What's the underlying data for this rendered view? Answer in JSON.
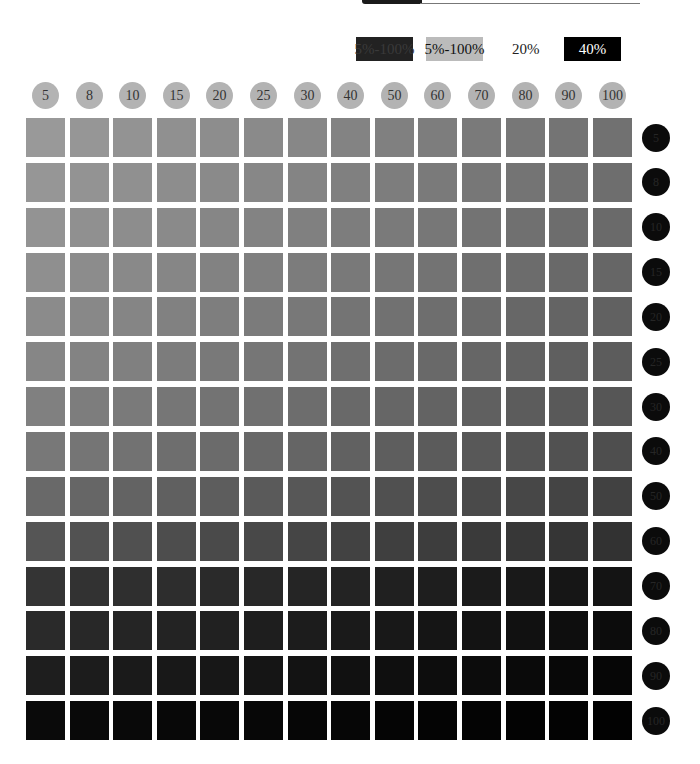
{
  "legend": [
    {
      "label": "5%-100%",
      "bg": "#222222",
      "fg": "#3a3a3a",
      "x": 356
    },
    {
      "label": "5%-100%",
      "bg": "#bbbbbb",
      "fg": "#111111",
      "x": 426
    },
    {
      "label": "20%",
      "bg": "transparent",
      "fg": "#222222",
      "x": 512,
      "plain": true
    },
    {
      "label": "40%",
      "bg": "#000000",
      "fg": "#ffffff",
      "x": 564
    }
  ],
  "chart_data": {
    "type": "heatmap",
    "title": "",
    "xlabel": "",
    "ylabel": "",
    "columns": [
      "5",
      "8",
      "10",
      "15",
      "20",
      "25",
      "30",
      "40",
      "50",
      "60",
      "70",
      "80",
      "90",
      "100"
    ],
    "rows": [
      "5",
      "8",
      "10",
      "15",
      "20",
      "25",
      "30",
      "40",
      "50",
      "60",
      "70",
      "80",
      "90",
      "100"
    ],
    "legend": [
      "5%-100%",
      "5%-100%",
      "20%",
      "40%"
    ],
    "row_start_gray": [
      153,
      150,
      147,
      143,
      139,
      134,
      128,
      120,
      105,
      85,
      52,
      42,
      30,
      10
    ],
    "row_end_gray": [
      113,
      110,
      106,
      102,
      97,
      92,
      86,
      78,
      65,
      50,
      20,
      12,
      6,
      2
    ]
  }
}
